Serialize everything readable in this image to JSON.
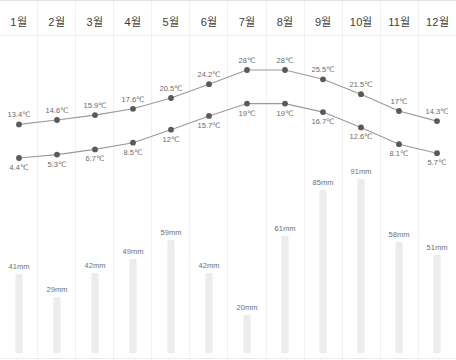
{
  "chart_data": {
    "type": "line",
    "title": "",
    "xlabel": "",
    "ylabel": "",
    "grid": "vertical-column-dividers",
    "legend": "none",
    "categories": [
      "1월",
      "2월",
      "3월",
      "4월",
      "5월",
      "6월",
      "7월",
      "8월",
      "9월",
      "10월",
      "11월",
      "12월"
    ],
    "series": [
      {
        "name": "high-temperature",
        "unit": "℃",
        "type": "line",
        "values": [
          13.4,
          14.6,
          15.9,
          17.6,
          20.5,
          24.2,
          28,
          28,
          25.5,
          21.5,
          17,
          14.3
        ],
        "labels": [
          "13.4℃",
          "14.6℃",
          "15.9℃",
          "17.6℃",
          "20.5℃",
          "24.2℃",
          "28℃",
          "28℃",
          "25.5℃",
          "21.5℃",
          "17℃",
          "14.3℃"
        ]
      },
      {
        "name": "low-temperature",
        "unit": "℃",
        "type": "line",
        "values": [
          4.4,
          5.3,
          6.7,
          8.5,
          12,
          15.7,
          19,
          19,
          16.7,
          12.6,
          8.1,
          5.7
        ],
        "labels": [
          "4.4℃",
          "5.3℃",
          "6.7℃",
          "8.5℃",
          "12℃",
          "15.7℃",
          "19℃",
          "19℃",
          "16.7℃",
          "12.6℃",
          "8.1℃",
          "5.7℃"
        ]
      },
      {
        "name": "rainfall",
        "unit": "mm",
        "type": "bar",
        "values": [
          41,
          29,
          42,
          49,
          59,
          42,
          20,
          61,
          85,
          91,
          58,
          51
        ],
        "labels": [
          "41mm",
          "29mm",
          "42mm",
          "49mm",
          "59mm",
          "42mm",
          "20mm",
          "61mm",
          "85mm",
          "91mm",
          "58mm",
          "51mm"
        ]
      }
    ],
    "ylim_temp": [
      0,
      30
    ],
    "ylim_rain": [
      0,
      95
    ]
  },
  "colors": {
    "line": "#9a9a9a",
    "dot": "#5a5a5a",
    "bar": "#ececec",
    "label_text": "#6a6a6a",
    "month_text": "#3c3c3c",
    "grid": "#f0f0f0"
  }
}
